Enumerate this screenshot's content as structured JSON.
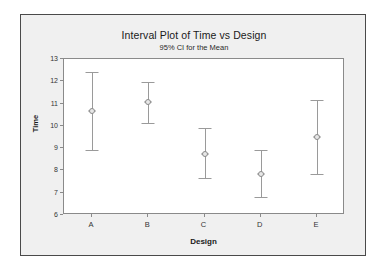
{
  "chart_data": {
    "type": "scatter",
    "title": "Interval Plot of Time vs Design",
    "subtitle": "95% CI for the Mean",
    "xlabel": "Design",
    "ylabel": "Time",
    "categories": [
      "A",
      "B",
      "C",
      "D",
      "E"
    ],
    "ylim": [
      6,
      13
    ],
    "yticks": [
      6,
      7,
      8,
      9,
      10,
      11,
      12,
      13
    ],
    "ytick_labels": [
      "6",
      "7",
      "8",
      "9",
      "10",
      "11",
      "12",
      "13"
    ],
    "grid": false,
    "legend": "none",
    "series": [
      {
        "name": "Mean with 95% CI",
        "means": [
          10.65,
          11.05,
          8.75,
          7.85,
          9.5
        ],
        "ci_lower": [
          8.9,
          10.15,
          7.65,
          6.8,
          7.85
        ],
        "ci_upper": [
          12.4,
          11.95,
          9.9,
          8.9,
          11.15
        ]
      }
    ],
    "points": [
      {
        "category": "A",
        "mean": 10.65,
        "lower": 8.9,
        "upper": 12.4
      },
      {
        "category": "B",
        "mean": 11.05,
        "lower": 10.15,
        "upper": 11.95
      },
      {
        "category": "C",
        "mean": 8.75,
        "lower": 7.65,
        "upper": 9.9
      },
      {
        "category": "D",
        "mean": 7.85,
        "lower": 6.8,
        "upper": 8.9
      },
      {
        "category": "E",
        "mean": 9.5,
        "lower": 7.85,
        "upper": 11.15
      }
    ],
    "colors": {
      "panel_background": "#f0f0f0",
      "plot_background": "#ffffff",
      "frame": "#4a4a4a",
      "axis": "#8a8a8a",
      "interval": "#9a9a9a",
      "text": "#1a1a1a"
    }
  }
}
